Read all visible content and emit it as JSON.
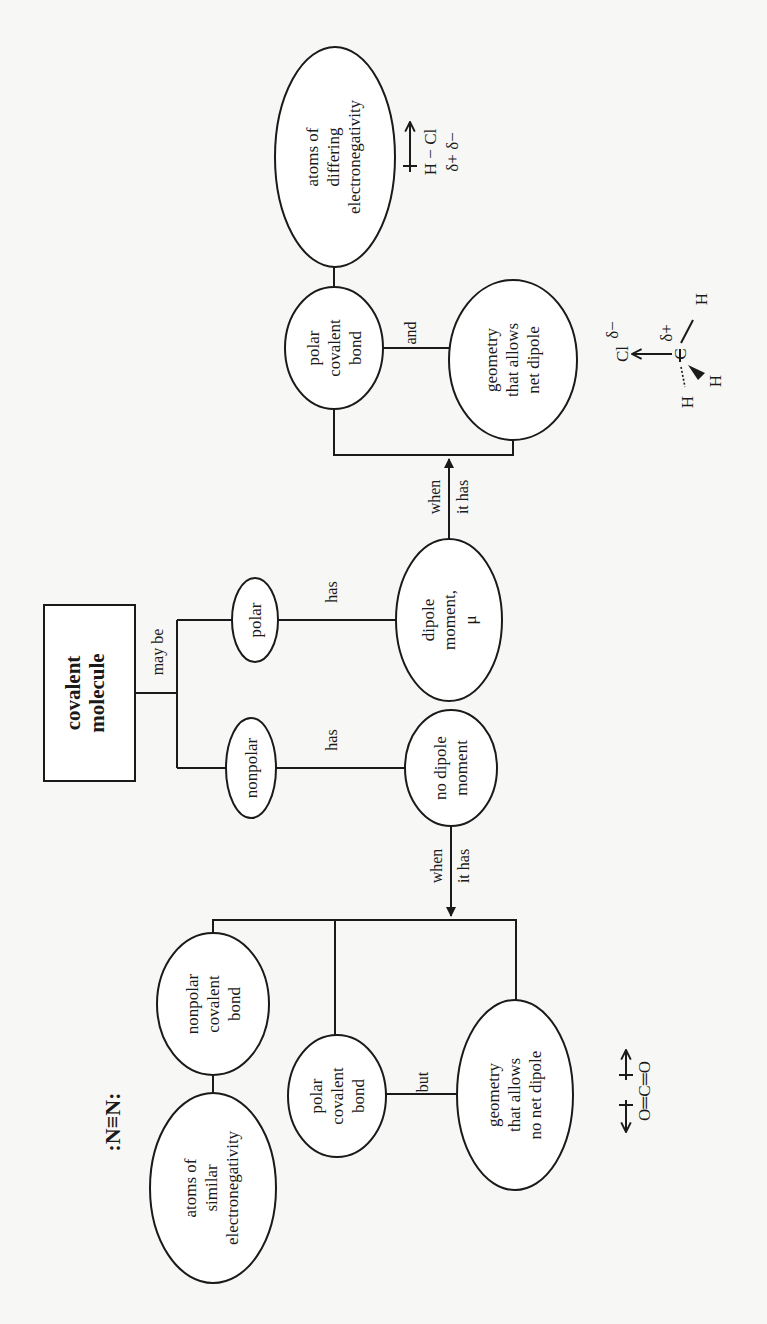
{
  "diagram": {
    "orientation": "rotated 90 degrees counter-clockwise",
    "root": {
      "label_lines": [
        "covalent",
        "molecule"
      ]
    },
    "edge_labels": {
      "may_be": "may be",
      "has_nonpolar": "has",
      "has_polar": "has",
      "when_1": "when",
      "it_has_1": "it has",
      "when_2": "when",
      "it_has_2": "it has",
      "and": "and",
      "but": "but"
    },
    "nodes": {
      "nonpolar": {
        "label_lines": [
          "nonpolar"
        ]
      },
      "polar": {
        "label_lines": [
          "polar"
        ]
      },
      "no_dipole": {
        "label_lines": [
          "no dipole",
          "moment"
        ]
      },
      "dipole": {
        "label_lines": [
          "dipole",
          "moment,",
          "μ"
        ]
      },
      "polar_bond_right": {
        "label_lines": [
          "polar",
          "covalent",
          "bond"
        ]
      },
      "differing": {
        "label_lines": [
          "atoms of",
          "differing",
          "electronegativity"
        ]
      },
      "geometry_net": {
        "label_lines": [
          "geometry",
          "that allows",
          "net dipole"
        ]
      },
      "nonpolar_bond": {
        "label_lines": [
          "nonpolar",
          "covalent",
          "bond"
        ]
      },
      "similar": {
        "label_lines": [
          "atoms of",
          "similar",
          "electronegativity"
        ]
      },
      "polar_bond_left": {
        "label_lines": [
          "polar",
          "covalent",
          "bond"
        ]
      },
      "geometry_no_net": {
        "label_lines": [
          "geometry",
          "that allows",
          "no net dipole"
        ]
      }
    },
    "examples": {
      "hcl": {
        "formula": "H − Cl",
        "charges": "δ+   δ−"
      },
      "ch3cl": {
        "cl": "Cl",
        "delta_minus": "δ−",
        "delta_plus": "δ+",
        "c": "C",
        "h": "H"
      },
      "n2": {
        "formula": ":N≡N:"
      },
      "co2": {
        "formula": "O═C═O"
      }
    }
  }
}
